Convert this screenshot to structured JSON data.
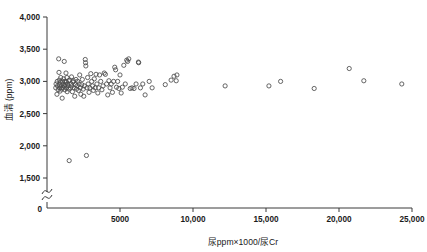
{
  "chart_data": {
    "type": "scatter",
    "title": "",
    "xlabel": "尿ppm×1000/尿Cr",
    "ylabel": "血清 (ppm)",
    "xlim": [
      0,
      25000
    ],
    "ylim": [
      1500,
      4000
    ],
    "y_axis_break": true,
    "y_break_label": "0",
    "grid": false,
    "legend": null,
    "marker_style": "open-circle",
    "xticks": [
      5000,
      10000,
      15000,
      20000,
      25000
    ],
    "xtick_labels": [
      "5000",
      "10,000",
      "15,000",
      "20,000",
      "25,000"
    ],
    "yticks": [
      1500,
      2000,
      2500,
      3000,
      3500,
      4000
    ],
    "ytick_labels": [
      "1,500",
      "2,000",
      "2,500",
      "3,000",
      "3,500",
      "4,000"
    ],
    "points": [
      [
        600,
        2900
      ],
      [
        620,
        2960
      ],
      [
        680,
        2800
      ],
      [
        700,
        3000
      ],
      [
        720,
        2930
      ],
      [
        760,
        2870
      ],
      [
        800,
        3350
      ],
      [
        820,
        3140
      ],
      [
        840,
        3020
      ],
      [
        860,
        2950
      ],
      [
        880,
        2900
      ],
      [
        900,
        2850
      ],
      [
        920,
        2990
      ],
      [
        940,
        3060
      ],
      [
        960,
        2930
      ],
      [
        1000,
        2880
      ],
      [
        1040,
        2740
      ],
      [
        1060,
        3000
      ],
      [
        1080,
        2960
      ],
      [
        1100,
        2900
      ],
      [
        1140,
        3040
      ],
      [
        1180,
        3310
      ],
      [
        1200,
        2930
      ],
      [
        1220,
        2870
      ],
      [
        1240,
        3000
      ],
      [
        1260,
        2950
      ],
      [
        1300,
        3130
      ],
      [
        1320,
        2990
      ],
      [
        1340,
        2900
      ],
      [
        1360,
        3060
      ],
      [
        1380,
        2840
      ],
      [
        1400,
        2960
      ],
      [
        1440,
        2930
      ],
      [
        1480,
        3010
      ],
      [
        1500,
        2880
      ],
      [
        1520,
        1770
      ],
      [
        1560,
        3020
      ],
      [
        1600,
        2900
      ],
      [
        1640,
        2960
      ],
      [
        1680,
        3070
      ],
      [
        1700,
        2930
      ],
      [
        1740,
        2840
      ],
      [
        1780,
        2990
      ],
      [
        1820,
        3010
      ],
      [
        1860,
        2900
      ],
      [
        1900,
        2770
      ],
      [
        1940,
        2950
      ],
      [
        1980,
        3030
      ],
      [
        2020,
        2880
      ],
      [
        2060,
        2930
      ],
      [
        2100,
        3000
      ],
      [
        2160,
        2860
      ],
      [
        2200,
        2960
      ],
      [
        2240,
        3100
      ],
      [
        2280,
        2900
      ],
      [
        2320,
        2800
      ],
      [
        2380,
        2950
      ],
      [
        2420,
        3030
      ],
      [
        2480,
        2880
      ],
      [
        2520,
        2770
      ],
      [
        2560,
        2930
      ],
      [
        2620,
        3340
      ],
      [
        2640,
        3290
      ],
      [
        2660,
        3240
      ],
      [
        2700,
        1850
      ],
      [
        2740,
        2900
      ],
      [
        2780,
        3060
      ],
      [
        2820,
        2960
      ],
      [
        2880,
        2830
      ],
      [
        2940,
        2900
      ],
      [
        3000,
        3120
      ],
      [
        3060,
        3000
      ],
      [
        3120,
        2930
      ],
      [
        3180,
        2860
      ],
      [
        3240,
        3040
      ],
      [
        3300,
        2900
      ],
      [
        3360,
        3110
      ],
      [
        3420,
        2960
      ],
      [
        3480,
        2820
      ],
      [
        3540,
        2900
      ],
      [
        3600,
        3100
      ],
      [
        3680,
        3000
      ],
      [
        3760,
        2870
      ],
      [
        3840,
        2930
      ],
      [
        3920,
        3130
      ],
      [
        4000,
        3110
      ],
      [
        4080,
        2960
      ],
      [
        4160,
        2790
      ],
      [
        4240,
        3010
      ],
      [
        4320,
        2900
      ],
      [
        4400,
        2960
      ],
      [
        4480,
        2830
      ],
      [
        4560,
        3000
      ],
      [
        4640,
        3220
      ],
      [
        4700,
        3180
      ],
      [
        4760,
        2910
      ],
      [
        4840,
        3000
      ],
      [
        4920,
        2890
      ],
      [
        5000,
        3100
      ],
      [
        5080,
        2820
      ],
      [
        5160,
        2910
      ],
      [
        5260,
        3250
      ],
      [
        5360,
        2960
      ],
      [
        5460,
        3330
      ],
      [
        5520,
        3310
      ],
      [
        5600,
        3350
      ],
      [
        5700,
        2890
      ],
      [
        5820,
        2900
      ],
      [
        5960,
        2890
      ],
      [
        6100,
        2960
      ],
      [
        6260,
        3300
      ],
      [
        6280,
        3290
      ],
      [
        6400,
        2900
      ],
      [
        6560,
        2960
      ],
      [
        6720,
        2790
      ],
      [
        7000,
        3000
      ],
      [
        7200,
        2900
      ],
      [
        8100,
        2950
      ],
      [
        8500,
        3020
      ],
      [
        8700,
        3080
      ],
      [
        8850,
        3010
      ],
      [
        8900,
        3100
      ],
      [
        12200,
        2930
      ],
      [
        15200,
        2930
      ],
      [
        16000,
        3000
      ],
      [
        18300,
        2890
      ],
      [
        20700,
        3200
      ],
      [
        21700,
        3010
      ],
      [
        24300,
        2960
      ]
    ]
  },
  "axis": {
    "y_break_symbol": "break",
    "origin_label": "0"
  }
}
